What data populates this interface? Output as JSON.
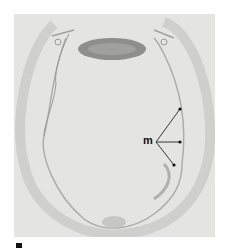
{
  "figure": {
    "type": "micrograph",
    "annotations": [
      {
        "label": "m",
        "pointers": 3
      }
    ],
    "panel_label_partial": true,
    "colors": {
      "background": "#e4e4e2",
      "tissue_outline": "#b8b8b6",
      "dark_structure": "#8a8a88",
      "label": "#111111"
    }
  }
}
